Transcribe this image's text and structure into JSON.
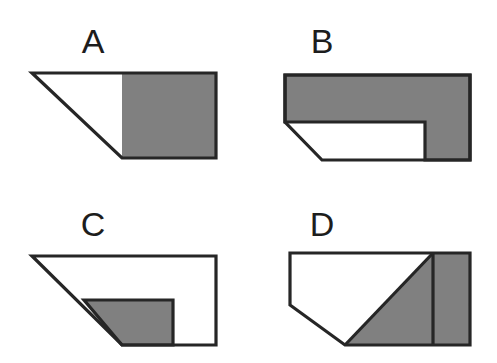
{
  "page": {
    "background_color": "#ffffff",
    "width": 497,
    "height": 363
  },
  "style": {
    "shaded_color": "#808080",
    "unshaded_color": "#ffffff",
    "outline_color": "#262626",
    "label_color": "#1d1d1d",
    "outline_width": 3.2
  },
  "figures": [
    {
      "id": "figure-a",
      "label": "A",
      "label_x": 93,
      "label_y": 53,
      "description": "Right trapezoid with long top edge, vertical right edge, short bottom edge and a diagonal left side; the right half is shaded.",
      "outline_points": "32,73 216,73 216,158 122,158",
      "shaded_regions": [
        {
          "name": "right-square",
          "points": "122,73 216,73 216,158 122,158"
        }
      ],
      "dividers": []
    },
    {
      "id": "figure-b",
      "label": "B",
      "label_x": 322,
      "label_y": 53,
      "description": "Pentagon with a cut lower-left corner; an L-shaped shaded band covers the top strip and the right column, leaving a white notch at lower left.",
      "outline_points": "285,75 470,75 470,160 322,160 285,122",
      "shaded_regions": [
        {
          "name": "top-band-and-right-column",
          "points": "285,75 470,75 470,160 425,160 425,122 285,122"
        }
      ],
      "dividers": []
    },
    {
      "id": "figure-c",
      "label": "C",
      "label_x": 93,
      "label_y": 236,
      "description": "Right trapezoid identical in outline to A, mostly unshaded, with a small shaded quadrilateral along the lower middle bounded by the diagonal.",
      "outline_points": "32,256 216,256 216,345 122,345",
      "shaded_regions": [
        {
          "name": "lower-middle-block",
          "points": "84,300 173,300 173,345 122,345"
        }
      ],
      "dividers": []
    },
    {
      "id": "figure-d",
      "label": "D",
      "label_x": 322,
      "label_y": 236,
      "description": "Pentagon with a cut lower-left corner; a diagonal from the top edge to the bottom-left vertex separates a white upper-left region from a shaded lower-right triangle, and a vertical line marks off a shaded rectangle at the right.",
      "outline_points": "290,253 470,253 470,345 345,345 290,305",
      "shaded_regions": [
        {
          "name": "diagonal-triangle",
          "points": "433,253 433,345 345,345"
        },
        {
          "name": "right-rectangle",
          "points": "433,253 470,253 470,345 433,345"
        }
      ],
      "dividers": [
        {
          "name": "vertical-divider",
          "x1": 433,
          "y1": 253,
          "x2": 433,
          "y2": 345
        },
        {
          "name": "diagonal-divider",
          "x1": 433,
          "y1": 253,
          "x2": 345,
          "y2": 345
        }
      ]
    }
  ]
}
